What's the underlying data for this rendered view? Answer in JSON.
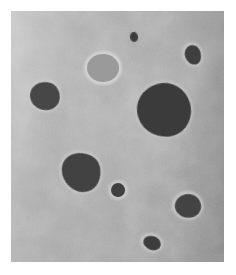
{
  "image": {
    "kind": "grayscale-micrograph",
    "width": 236,
    "height": 275,
    "border_color": "#ffffff",
    "alt_text": "Grayscale micrograph of dark rounded particles dispersed in a mottled gray matrix"
  },
  "matrix": {
    "name": "gray-matrix-panel",
    "x": 11,
    "y": 11,
    "width": 213,
    "height": 251,
    "base_color": "#a8a8a8",
    "light_color": "#bdbdbd",
    "dark_color": "#909090",
    "texture": "mottled-grain"
  },
  "particles": [
    {
      "id": "particle-small-top-center",
      "label": "small dark dot, upper center",
      "cx": 134,
      "cy": 37,
      "rx": 4,
      "ry": 5,
      "color": "#3c3c3c",
      "halo": false,
      "rotation": -8,
      "roundness": "50% 48% 52% 50% / 48% 52% 48% 52%"
    },
    {
      "id": "particle-top-right",
      "label": "dark ovoid, upper right",
      "cx": 193,
      "cy": 55,
      "rx": 8,
      "ry": 10,
      "color": "#3f3f3f",
      "halo": true,
      "halo_color": "#c2c2c2",
      "rotation": -18,
      "roundness": "52% 48% 46% 54% / 48% 44% 56% 52%"
    },
    {
      "id": "particle-light-gray",
      "label": "light gray disc with bright rim, upper center-left",
      "cx": 103,
      "cy": 68,
      "rx": 16,
      "ry": 14,
      "color": "#9a9a9a",
      "halo": true,
      "halo_color": "#d2d2d2",
      "rotation": 0,
      "roundness": "50% 50% 50% 50% / 50% 50% 50% 50%"
    },
    {
      "id": "particle-upper-left",
      "label": "dark rounded particle, upper left",
      "cx": 45,
      "cy": 96,
      "rx": 15,
      "ry": 14,
      "color": "#474747",
      "halo": true,
      "halo_color": "#c8c8c8",
      "rotation": 12,
      "roundness": "54% 46% 48% 52% / 50% 54% 46% 50%"
    },
    {
      "id": "particle-large-center-right",
      "label": "large dark particle, center right",
      "cx": 164,
      "cy": 110,
      "rx": 27,
      "ry": 27,
      "color": "#3b3b3b",
      "halo": true,
      "halo_color": "#c0c0c0",
      "rotation": -6,
      "roundness": "52% 48% 46% 54% / 48% 52% 48% 52%"
    },
    {
      "id": "particle-center-left",
      "label": "irregular dark particle, center left",
      "cx": 81,
      "cy": 172,
      "rx": 20,
      "ry": 19,
      "color": "#424242",
      "halo": true,
      "halo_color": "#c4c4c4",
      "rotation": 24,
      "roundness": "56% 44% 42% 58% / 46% 56% 44% 54%"
    },
    {
      "id": "particle-small-center",
      "label": "small dark particle, center",
      "cx": 118,
      "cy": 190,
      "rx": 7,
      "ry": 7,
      "color": "#3f3f3f",
      "halo": true,
      "halo_color": "#c6c6c6",
      "rotation": 0,
      "roundness": "52% 48% 50% 50% / 50% 52% 48% 50%"
    },
    {
      "id": "particle-lower-right",
      "label": "dark particle, lower right",
      "cx": 188,
      "cy": 206,
      "rx": 13,
      "ry": 12,
      "color": "#434343",
      "halo": true,
      "halo_color": "#c6c6c6",
      "rotation": -14,
      "roundness": "50% 50% 44% 56% / 46% 54% 46% 54%"
    },
    {
      "id": "particle-bottom-center",
      "label": "small dark particle, bottom center",
      "cx": 152,
      "cy": 243,
      "rx": 9,
      "ry": 7,
      "color": "#3d3d3d",
      "halo": true,
      "halo_color": "#c6c6c6",
      "rotation": 20,
      "roundness": "54% 46% 48% 52% / 48% 54% 46% 52%"
    }
  ]
}
